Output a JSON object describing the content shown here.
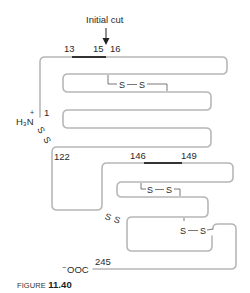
{
  "annotation": {
    "initial_cut": "Initial cut"
  },
  "residue_labels": {
    "r13": "13",
    "r15": "15",
    "r16": "16",
    "r1": "1",
    "r122": "122",
    "r146": "146",
    "r149": "149",
    "r245": "245"
  },
  "termini": {
    "n_terminus": "H₃N",
    "n_charge": "+",
    "c_terminus": "OOC",
    "c_charge": "−"
  },
  "disulfides": {
    "s": "S",
    "bond": "—"
  },
  "caption": {
    "prefix": "FIGURE",
    "number": "11.40"
  },
  "colors": {
    "chain": "#b7b7b7",
    "highlight": "#333333",
    "text": "#2a2a2a"
  }
}
